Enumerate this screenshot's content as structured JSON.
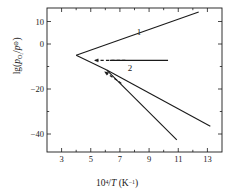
{
  "chart_data": {
    "type": "line",
    "title": "",
    "xlabel": "10^4/T (K^-1)",
    "ylabel": "lg(p_O2/p^o)",
    "xlim": [
      2,
      14
    ],
    "ylim": [
      -48,
      16
    ],
    "grid": false,
    "legend": "none",
    "xticks": [
      3,
      5,
      7,
      9,
      11,
      13
    ],
    "xtick_labels": [
      "3",
      "5",
      "7",
      "9",
      "11",
      "13"
    ],
    "xminorticks": [
      2,
      4,
      6,
      8,
      10,
      12,
      14
    ],
    "yticks": [
      10,
      0,
      -20,
      -40
    ],
    "ytick_labels": [
      "10",
      "0",
      "−20",
      "−40"
    ],
    "yminorticks": [
      -10,
      -30
    ],
    "annotations": [
      {
        "text": "1",
        "x": 8.3,
        "y": 5.5
      },
      {
        "text": "2",
        "x": 7.7,
        "y": -10.5
      }
    ],
    "series": [
      {
        "name": "1",
        "style": "solid",
        "points": [
          [
            4.0,
            -5.0
          ],
          [
            12.4,
            14.2
          ]
        ]
      },
      {
        "name": "2",
        "style": "solid",
        "points": [
          [
            6.3,
            -7.3
          ],
          [
            10.3,
            -7.3
          ]
        ]
      },
      {
        "name": "vertex-lower-branch",
        "style": "solid",
        "points": [
          [
            4.0,
            -5.0
          ],
          [
            6.1,
            -11.6
          ]
        ]
      },
      {
        "name": "lower-branch-a",
        "style": "solid",
        "points": [
          [
            6.1,
            -11.6
          ],
          [
            13.2,
            -36.6
          ]
        ]
      },
      {
        "name": "lower-branch-b",
        "style": "solid",
        "points": [
          [
            6.1,
            -11.6
          ],
          [
            10.9,
            -42.6
          ]
        ]
      },
      {
        "name": "dashed-to-line-2",
        "style": "dashed",
        "points": [
          [
            5.3,
            -7.3
          ],
          [
            7.4,
            -7.3
          ]
        ]
      },
      {
        "name": "dashed-to-lower-branch",
        "style": "dashed",
        "points": [
          [
            7.1,
            -17.5
          ],
          [
            5.9,
            -12.1
          ]
        ]
      }
    ],
    "arrows": [
      {
        "name": "arrow-left-on-dashed",
        "from": [
          5.9,
          -7.3
        ],
        "to": [
          5.25,
          -7.3
        ]
      },
      {
        "name": "arrow-upleft-on-dashed",
        "from": [
          6.6,
          -15.3
        ],
        "to": [
          5.95,
          -12.3
        ]
      }
    ],
    "colors": {
      "axis": "#1a1a1a",
      "curve": "#1a1a1a",
      "background": "#ffffff"
    }
  },
  "axes": {
    "x_title_html": "10<sup>4</sup>/<span class=\"ital\">T</span> (K<sup>−1</sup>)",
    "y_title_html": "lg(<span class=\"ital\">p</span><sub>O<sub>2</sub></sub>/<span class=\"ital\">p</span><sup>⊖</sup>)"
  }
}
